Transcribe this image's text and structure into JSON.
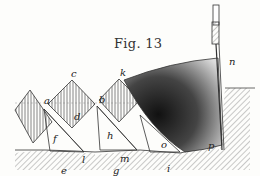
{
  "figure": {
    "title": "Fig. 13",
    "labels": [
      {
        "id": "c",
        "text": "c",
        "x": 71,
        "y": 69
      },
      {
        "id": "k",
        "text": "k",
        "x": 120,
        "y": 68
      },
      {
        "id": "n",
        "text": "n",
        "x": 229,
        "y": 57
      },
      {
        "id": "a",
        "text": "a",
        "x": 44,
        "y": 96
      },
      {
        "id": "b",
        "text": "b",
        "x": 99,
        "y": 95
      },
      {
        "id": "d",
        "text": "d",
        "x": 74,
        "y": 112
      },
      {
        "id": "f",
        "text": "f",
        "x": 53,
        "y": 134
      },
      {
        "id": "h",
        "text": "h",
        "x": 107,
        "y": 131
      },
      {
        "id": "o",
        "text": "o",
        "x": 161,
        "y": 140
      },
      {
        "id": "p",
        "text": "p",
        "x": 208,
        "y": 141
      },
      {
        "id": "l",
        "text": "l",
        "x": 82,
        "y": 155
      },
      {
        "id": "m",
        "text": "m",
        "x": 120,
        "y": 154
      },
      {
        "id": "e",
        "text": "e",
        "x": 61,
        "y": 166
      },
      {
        "id": "g",
        "text": "g",
        "x": 113,
        "y": 166
      },
      {
        "id": "i",
        "text": "i",
        "x": 167,
        "y": 164
      }
    ],
    "colors": {
      "ink": "#222222",
      "paper": "#fdfdfb",
      "hatch": "#555555"
    }
  }
}
